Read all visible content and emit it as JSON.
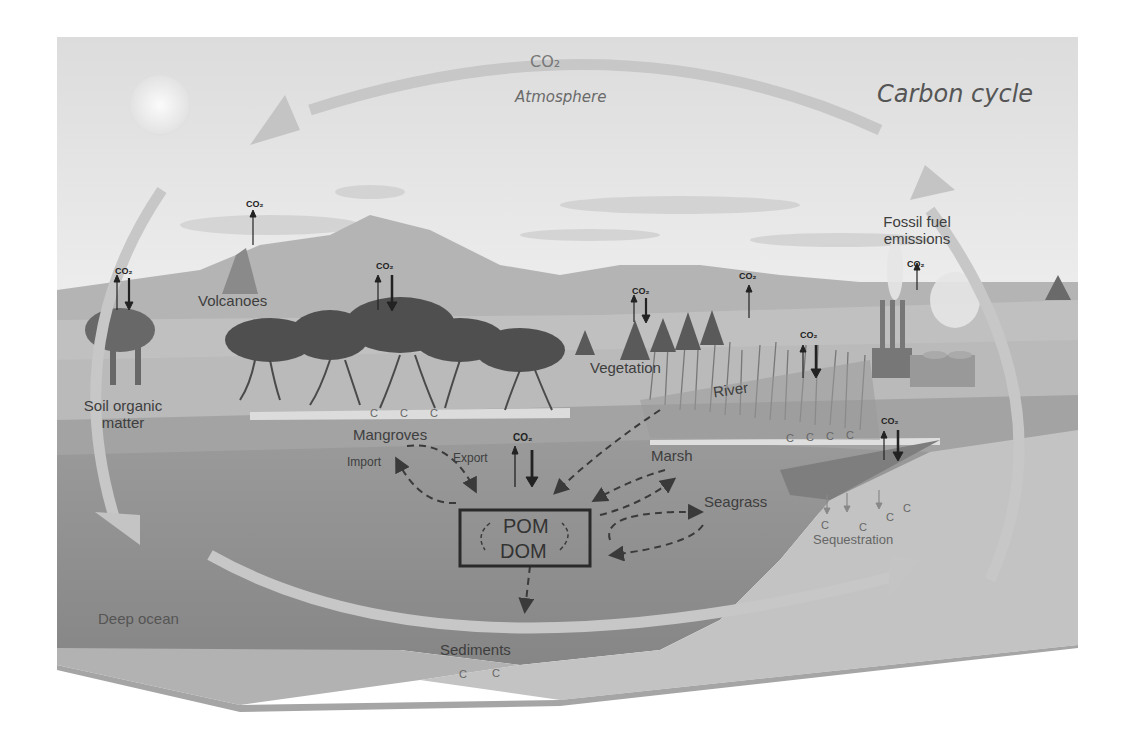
{
  "diagram": {
    "title": "Carbon cycle",
    "atmosphere_co2": "CO₂",
    "atmosphere_label": "Atmosphere",
    "labels": {
      "volcanoes": "Volcanoes",
      "soil_line1": "Soil organic",
      "soil_line2": "matter",
      "mangroves": "Mangroves",
      "vegetation": "Vegetation",
      "river": "River",
      "fossil_line1": "Fossil fuel",
      "fossil_line2": "emissions",
      "marsh": "Marsh",
      "seagrass": "Seagrass",
      "sequestration": "Sequestration",
      "import": "Import",
      "export": "Export",
      "pom": "POM",
      "dom": "DOM",
      "sediments": "Sediments",
      "deep_ocean": "Deep ocean"
    },
    "co2_marker": "CO₂",
    "carbon_marker": "C",
    "colors": {
      "sky": "#e9e9e9",
      "hills_far": "#b9b9b9",
      "land": "#bfbfbf",
      "shelf": "#a9a9a9",
      "ocean": "#8f8f8f",
      "deep_ocean": "#848484",
      "sediment": "#c4c4c4",
      "cycle_arrow": "#c9c9c9",
      "box_border": "#2a2a2a"
    }
  }
}
